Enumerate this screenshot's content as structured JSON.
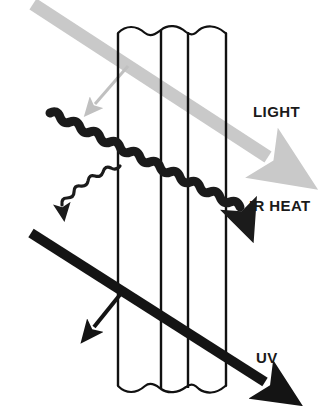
{
  "diagram": {
    "background_color": "#ffffff",
    "labels": [
      {
        "id": "light",
        "text": "LIGHT",
        "x": 253,
        "y": 104,
        "color": "#1a1a1a"
      },
      {
        "id": "ir_heat",
        "text": "IR HEAT",
        "x": 249,
        "y": 198,
        "color": "#1a1a1a"
      },
      {
        "id": "uv",
        "text": "UV",
        "x": 256,
        "y": 350,
        "color": "#1a1a1a"
      }
    ],
    "glass": {
      "name": "glass-panes",
      "stroke_color": "#111111",
      "fill_color": "#ffffff",
      "pane_edges_x": [
        118,
        161,
        188,
        226
      ],
      "top_y": 30,
      "bottom_y": 392,
      "edge_style": "wavy-break"
    },
    "rays": [
      {
        "id": "light-beam",
        "label": "LIGHT",
        "color": "#c9c9c9",
        "style": "thick-straight-arrow",
        "thickness": 13,
        "start": {
          "x": 33,
          "y": 4
        },
        "end": {
          "x": 281,
          "y": 166
        },
        "branch": {
          "id": "light-reflected",
          "color": "#c0c0c0",
          "thickness": 3,
          "start": {
            "x": 127,
            "y": 66
          },
          "end": {
            "x": 90,
            "y": 110
          }
        }
      },
      {
        "id": "ir-heat-wave",
        "label": "IR HEAT",
        "color": "#1b1b1b",
        "style": "thick-squiggle-arrow",
        "thickness": 9,
        "start": {
          "x": 48,
          "y": 112
        },
        "end": {
          "x": 246,
          "y": 244
        },
        "branch": {
          "id": "ir-heat-reflected",
          "color": "#1b1b1b",
          "style": "thin-squiggle-arrow",
          "thickness": 3,
          "start": {
            "x": 119,
            "y": 164
          },
          "end": {
            "x": 73,
            "y": 238
          }
        }
      },
      {
        "id": "uv-beam",
        "label": "UV",
        "color": "#141414",
        "style": "thick-straight-arrow",
        "thickness": 10,
        "start": {
          "x": 30,
          "y": 232
        },
        "end": {
          "x": 279,
          "y": 391
        },
        "branch": {
          "id": "uv-reflected",
          "color": "#141414",
          "thickness": 4,
          "start": {
            "x": 122,
            "y": 290
          },
          "end": {
            "x": 88,
            "y": 334
          }
        }
      }
    ]
  }
}
